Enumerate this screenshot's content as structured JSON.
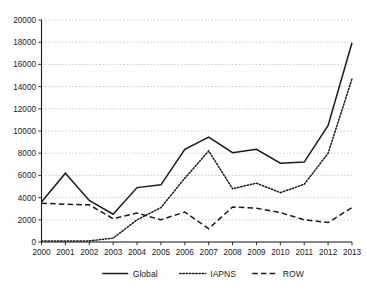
{
  "chart_data": {
    "type": "line",
    "title": "",
    "xlabel": "",
    "ylabel": "",
    "categories": [
      "2000",
      "2001",
      "2002",
      "2003",
      "2004",
      "2005",
      "2006",
      "2007",
      "2008",
      "2009",
      "2010",
      "2011",
      "2012",
      "2013"
    ],
    "x": [
      2000,
      2001,
      2002,
      2003,
      2004,
      2005,
      2006,
      2007,
      2008,
      2009,
      2010,
      2011,
      2012,
      2013
    ],
    "series": [
      {
        "name": "Global",
        "style": "solid",
        "values": [
          3600,
          6200,
          3750,
          2500,
          4900,
          5150,
          8350,
          9450,
          8050,
          8350,
          7100,
          7200,
          10500,
          17950
        ]
      },
      {
        "name": "IAPNS",
        "style": "dotted",
        "values": [
          100,
          100,
          100,
          350,
          2000,
          3100,
          5750,
          8200,
          4800,
          5300,
          4450,
          5200,
          8000,
          14700
        ]
      },
      {
        "name": "ROW",
        "style": "dashed",
        "values": [
          3500,
          3400,
          3350,
          2100,
          2600,
          2000,
          2700,
          1200,
          3150,
          3050,
          2650,
          2000,
          1750,
          3100
        ]
      }
    ],
    "ylim": [
      0,
      20000
    ],
    "yticks": [
      0,
      2000,
      4000,
      6000,
      8000,
      10000,
      12000,
      14000,
      16000,
      18000,
      20000
    ],
    "ytick_labels": [
      "0",
      "2000",
      "4000",
      "6000",
      "8000",
      "10000",
      "12000",
      "14000",
      "16000",
      "18000",
      "20000"
    ],
    "xlim": [
      2000,
      2013
    ],
    "grid": true,
    "grid_axis": "y",
    "legend": {
      "position": "bottom",
      "entries": [
        {
          "label": "Global",
          "style": "solid"
        },
        {
          "label": "IAPNS",
          "style": "dotted"
        },
        {
          "label": "ROW",
          "style": "dashed"
        }
      ]
    },
    "colors": {
      "line": "#1a1a1a",
      "grid": "#b9b9b9",
      "background": "#ffffff"
    }
  }
}
